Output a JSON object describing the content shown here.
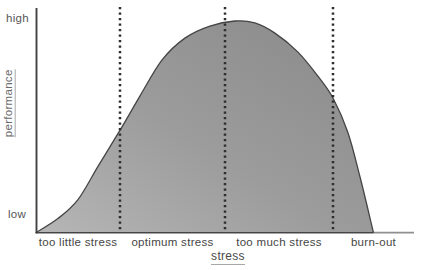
{
  "chart_data": {
    "type": "area",
    "title": "",
    "xlabel": "stress",
    "ylabel": "performance",
    "y_tick_labels": {
      "top": "high",
      "bottom": "low"
    },
    "x_range": [
      0,
      1
    ],
    "y_range": [
      0,
      1
    ],
    "grid": false,
    "legend": false,
    "colors": {
      "fill_light": "#b6b6b6",
      "fill_mid": "#9c9c9c",
      "fill_dark": "#898989",
      "curve_outline": "#454545",
      "divider_dots": "#2e2e2e",
      "y_axis": "#424242",
      "x_axis": "#8f8f8f",
      "label_text": "#464646",
      "underline": "#a8a8a8"
    },
    "dividers_x": [
      0.2222,
      0.5,
      0.7857
    ],
    "regions": [
      {
        "label": "too little stress",
        "x_start": 0.0,
        "x_end": 0.2222
      },
      {
        "label": "optimum stress",
        "x_start": 0.2222,
        "x_end": 0.5
      },
      {
        "label": "too much stress",
        "x_start": 0.5,
        "x_end": 0.7857
      },
      {
        "label": "burn-out",
        "x_start": 0.7857,
        "x_end": 1.0
      }
    ],
    "curve": [
      [
        0.0,
        0.0
      ],
      [
        0.058,
        0.066
      ],
      [
        0.111,
        0.156
      ],
      [
        0.164,
        0.313
      ],
      [
        0.222,
        0.483
      ],
      [
        0.275,
        0.645
      ],
      [
        0.333,
        0.815
      ],
      [
        0.394,
        0.919
      ],
      [
        0.46,
        0.976
      ],
      [
        0.526,
        1.0
      ],
      [
        0.579,
        0.991
      ],
      [
        0.632,
        0.943
      ],
      [
        0.693,
        0.853
      ],
      [
        0.746,
        0.739
      ],
      [
        0.786,
        0.635
      ],
      [
        0.825,
        0.474
      ],
      [
        0.857,
        0.265
      ],
      [
        0.892,
        0.005
      ]
    ]
  }
}
